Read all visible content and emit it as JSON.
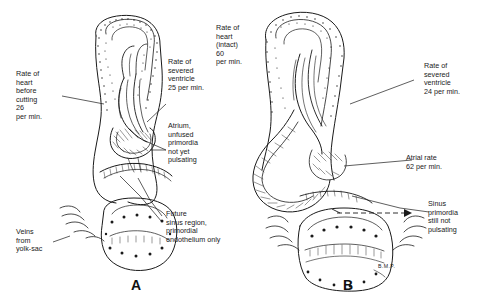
{
  "figure": {
    "type": "scientific-line-drawing",
    "background_color": "#ffffff",
    "ink_color": "#111111"
  },
  "panels": [
    {
      "letter": "A",
      "labels": [
        {
          "name": "rate-of-heart-before-cutting",
          "text": "Rate of\nheart\nbefore\ncutting\n26\nper min."
        },
        {
          "name": "rate-of-severed-ventricle",
          "text": "Rate of\nsevered\nventricle\n25 per min."
        },
        {
          "name": "atrium-unfused-primordia",
          "text": "Atrium,\nunfused\nprimordia\nnot yet\npulsating"
        },
        {
          "name": "future-sinus-region",
          "text": "Future\nsinus region,\nprimordial\nendothelium only"
        },
        {
          "name": "veins-from-yolk-sac",
          "text": "Veins\nfrom\nyolk-sac"
        }
      ]
    },
    {
      "letter": "B",
      "labels": [
        {
          "name": "rate-of-heart-intact",
          "text": "Rate of\nheart\n(intact)\n60\nper min."
        },
        {
          "name": "rate-of-severed-ventricle",
          "text": "Rate of\nsevered\nventricle\n24 per min."
        },
        {
          "name": "atrial-rate",
          "text": "Atrial rate\n62 per min."
        },
        {
          "name": "sinus-primordia",
          "text": "Sinus\nprimordia\nstill not\npulsating"
        },
        {
          "name": "bmp-abbreviation",
          "text": "B.M.P."
        }
      ]
    }
  ]
}
